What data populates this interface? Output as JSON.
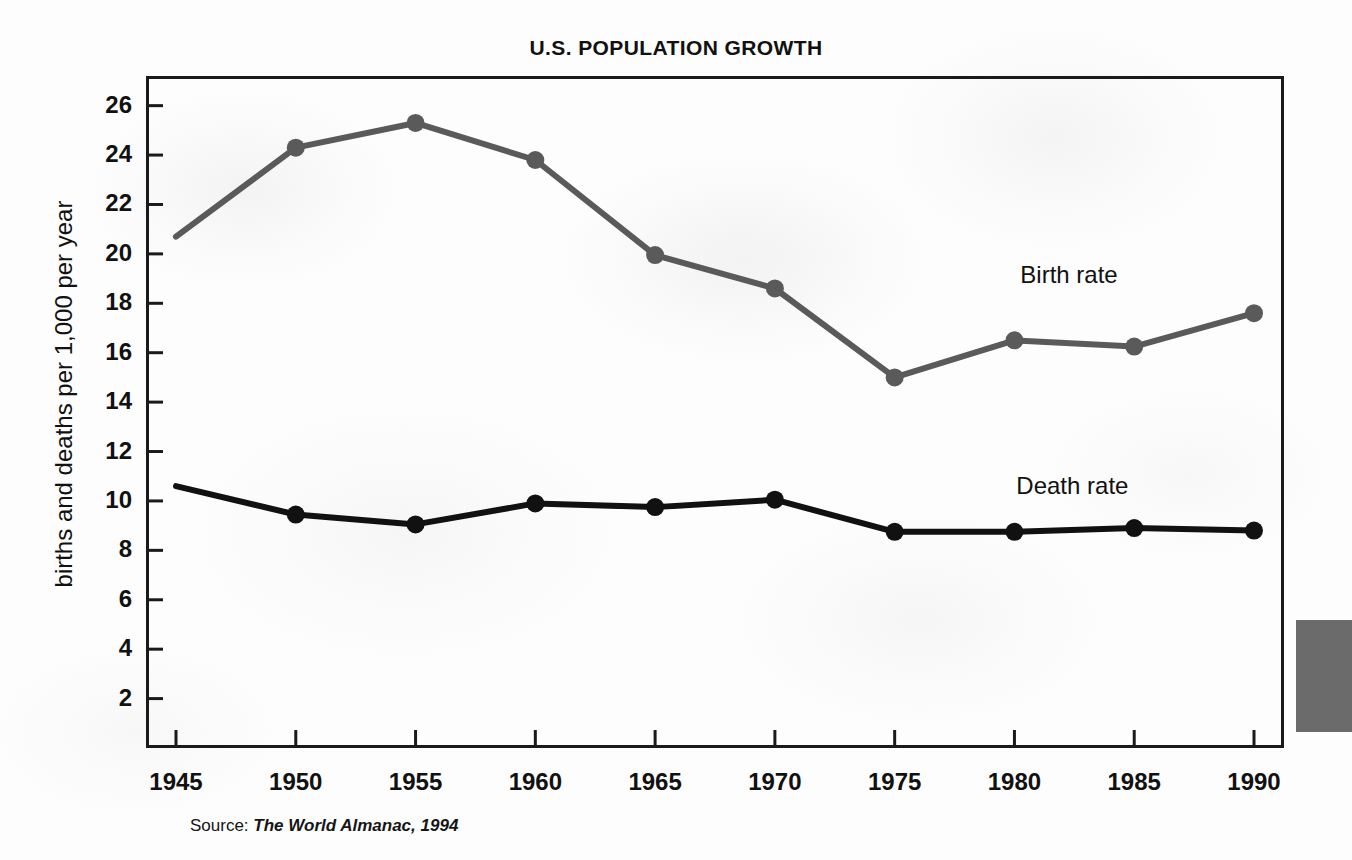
{
  "chart_data": {
    "type": "line",
    "title": "U.S. POPULATION GROWTH",
    "xlabel": "",
    "ylabel": "births and deaths per 1,000 per year",
    "x": [
      1945,
      1950,
      1955,
      1960,
      1965,
      1970,
      1975,
      1980,
      1985,
      1990
    ],
    "categories": [
      "1945",
      "1950",
      "1955",
      "1960",
      "1965",
      "1970",
      "1975",
      "1980",
      "1985",
      "1990"
    ],
    "series": [
      {
        "name": "Birth rate",
        "color": "#5a5a5a",
        "values": [
          20.7,
          24.3,
          25.3,
          23.8,
          19.95,
          18.6,
          15.0,
          16.5,
          16.25,
          17.6
        ],
        "marker_first_point": false
      },
      {
        "name": "Death rate",
        "color": "#111111",
        "values": [
          10.6,
          9.45,
          9.05,
          9.9,
          9.75,
          10.05,
          8.75,
          8.75,
          8.9,
          8.8
        ],
        "marker_first_point": false
      }
    ],
    "xlim": [
      1945,
      1990
    ],
    "ylim": [
      0,
      27.2
    ],
    "y_ticks": [
      2,
      4,
      6,
      8,
      10,
      12,
      14,
      16,
      18,
      20,
      22,
      24,
      26
    ],
    "y_tick_labels": [
      "2",
      "4",
      "6",
      "8",
      "10",
      "12",
      "14",
      "16",
      "18",
      "20",
      "22",
      "24",
      "26"
    ],
    "x_ticks": [
      1945,
      1950,
      1955,
      1960,
      1965,
      1970,
      1975,
      1980,
      1985,
      1990
    ],
    "grid": false,
    "legend": "inline-labels",
    "legend_position": "right-inline"
  },
  "annotations": {
    "birth_rate_label": "Birth rate",
    "death_rate_label": "Death rate"
  },
  "source": {
    "prefix": "Source:",
    "reference": "The World Almanac, 1994"
  },
  "colors": {
    "birth_rate": "#5a5a5a",
    "death_rate": "#111111",
    "frame": "#1a1a1a",
    "text": "#111111",
    "page_background": "#fdfdfd"
  }
}
